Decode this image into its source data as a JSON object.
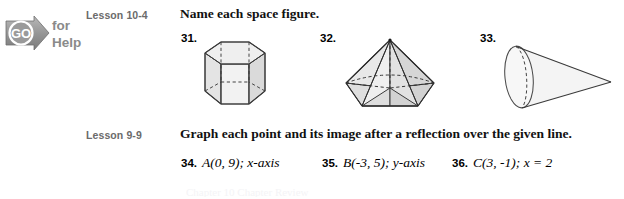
{
  "logo": {
    "badge_text": "GO",
    "line1": "for",
    "line2": "Help",
    "color": "#8a8a8a"
  },
  "sections": [
    {
      "lesson": "Lesson 10-4",
      "direction": "Name each space figure.",
      "exercises": [
        {
          "number": "31.",
          "figure": "hexagonal-prism"
        },
        {
          "number": "32.",
          "figure": "hexagonal-pyramid"
        },
        {
          "number": "33.",
          "figure": "cone"
        }
      ]
    },
    {
      "lesson": "Lesson 9-9",
      "direction": "Graph each point and its image after a reflection over the given line.",
      "exercises": [
        {
          "number": "34.",
          "point": "A(0, 9);",
          "line": "x-axis"
        },
        {
          "number": "35.",
          "point": "B(-3, 5);",
          "line": "y-axis"
        },
        {
          "number": "36.",
          "point": "C(3, -1);",
          "line": "x = 2"
        }
      ]
    }
  ],
  "footer_cut_text": "Chapter 10 Chapter Review",
  "colors": {
    "page_background": "#ffffff",
    "lesson_label": "#6b6b6b",
    "text": "#000000",
    "figure_fill_light": "#f0f0f0",
    "figure_fill_mid": "#dcdcdc",
    "figure_stroke": "#3a3a3a"
  }
}
